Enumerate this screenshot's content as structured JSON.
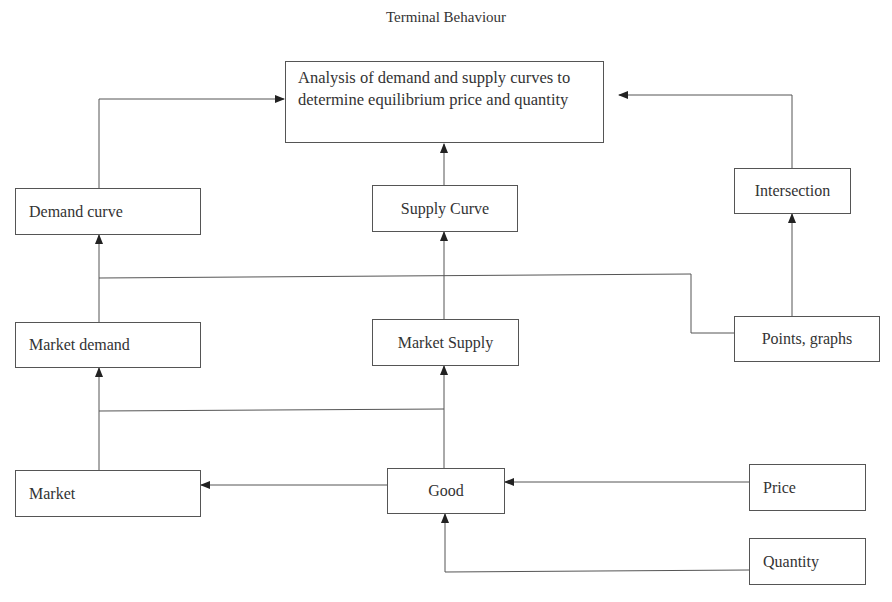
{
  "title": "Terminal Behaviour",
  "nodes": {
    "analysis": "Analysis of demand and supply curves to determine equilibrium price and quantity",
    "demand_curve": "Demand curve",
    "supply_curve": "Supply Curve",
    "intersection": "Intersection",
    "market_demand": "Market demand",
    "market_supply": "Market Supply",
    "points_graphs": "Points, graphs",
    "market": "Market",
    "good": "Good",
    "price": "Price",
    "quantity": "Quantity"
  },
  "edges": [
    {
      "from": "demand_curve",
      "to": "analysis"
    },
    {
      "from": "supply_curve",
      "to": "analysis"
    },
    {
      "from": "intersection",
      "to": "analysis"
    },
    {
      "from": "market_demand",
      "to": "demand_curve"
    },
    {
      "from": "market_supply",
      "to": "supply_curve"
    },
    {
      "from": "points_graphs",
      "to": "intersection"
    },
    {
      "from": "points_graphs",
      "to": "demand_curve"
    },
    {
      "from": "market",
      "to": "market_demand"
    },
    {
      "from": "good",
      "to": "market_supply"
    },
    {
      "from": "good",
      "to": "market"
    },
    {
      "from": "price",
      "to": "good"
    },
    {
      "from": "quantity",
      "to": "good"
    }
  ],
  "colors": {
    "line": "#555555",
    "text": "#333333",
    "background": "#ffffff"
  }
}
